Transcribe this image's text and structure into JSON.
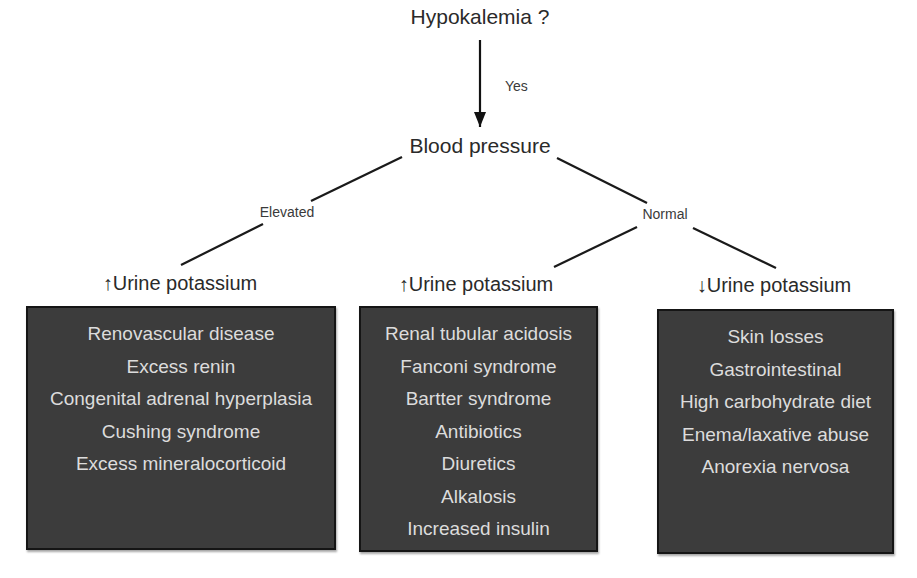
{
  "root": {
    "label": "Hypokalemia ?"
  },
  "edge_root": {
    "label": "Yes"
  },
  "bp_node": {
    "label": "Blood pressure"
  },
  "branches": {
    "elevated": "Elevated",
    "normal": "Normal"
  },
  "categories": [
    {
      "arrow": "↑",
      "label": "Urine potassium",
      "items": [
        "Renovascular disease",
        "Excess renin",
        "Congenital adrenal hyperplasia",
        "Cushing syndrome",
        "Excess mineralocorticoid"
      ]
    },
    {
      "arrow": "↑",
      "label": "Urine potassium",
      "items": [
        "Renal tubular acidosis",
        "Fanconi syndrome",
        "Bartter syndrome",
        "Antibiotics",
        "Diuretics",
        "Alkalosis",
        "Increased insulin"
      ]
    },
    {
      "arrow": "↓",
      "label": "Urine potassium",
      "items": [
        "Skin losses",
        "Gastrointestinal",
        "High carbohydrate diet",
        "Enema/laxative abuse",
        "Anorexia nervosa"
      ]
    }
  ],
  "colors": {
    "box_fill": "#3c3c3c",
    "box_text": "#dcdcdc",
    "line": "#1a1a1a"
  }
}
